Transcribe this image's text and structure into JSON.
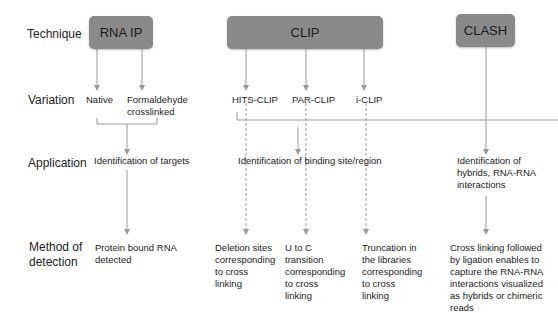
{
  "row_labels": {
    "technique": "Technique",
    "variation": "Variation",
    "application": "Application",
    "method_line1": "Method of",
    "method_line2": "detection"
  },
  "techniques": {
    "rna_ip": "RNA IP",
    "clip": "CLIP",
    "clash": "CLASH"
  },
  "variations": {
    "native": "Native",
    "formaldehyde": "Formaldehyde",
    "formaldehyde_line2": "crosslinked",
    "hits_clip": "HITS-CLIP",
    "par_clip": "PAR-CLIP",
    "i_clip": "i-CLIP"
  },
  "applications": {
    "rna_ip": "Identification of targets",
    "clip": "Identification of binding site/region",
    "clash_l1": "Identification of",
    "clash_l2": "hybrids, RNA-RNA",
    "clash_l3": "interactions"
  },
  "detection": {
    "rna_ip_l1": "Protein bound RNA",
    "rna_ip_l2": "detected",
    "hits_l1": "Deletion sites",
    "hits_l2": "corresponding",
    "hits_l3": "to cross",
    "hits_l4": "linking",
    "par_l1": "U to C",
    "par_l2": "transition",
    "par_l3": "corresponding",
    "par_l4": "to cross",
    "par_l5": "linking",
    "iclip_l1": "Truncation in",
    "iclip_l2": "the libraries",
    "iclip_l3": "corresponding",
    "iclip_l4": "to cross",
    "iclip_l5": "linking",
    "clash_l1": "Cross linking followed",
    "clash_l2": "by ligation enables to",
    "clash_l3": "capture the RNA-RNA",
    "clash_l4": "interactions visualized",
    "clash_l5": "as hybrids or chimeric",
    "clash_l6": "reads"
  },
  "colors": {
    "box_fill": "#8a8a8a",
    "line": "#999999"
  }
}
